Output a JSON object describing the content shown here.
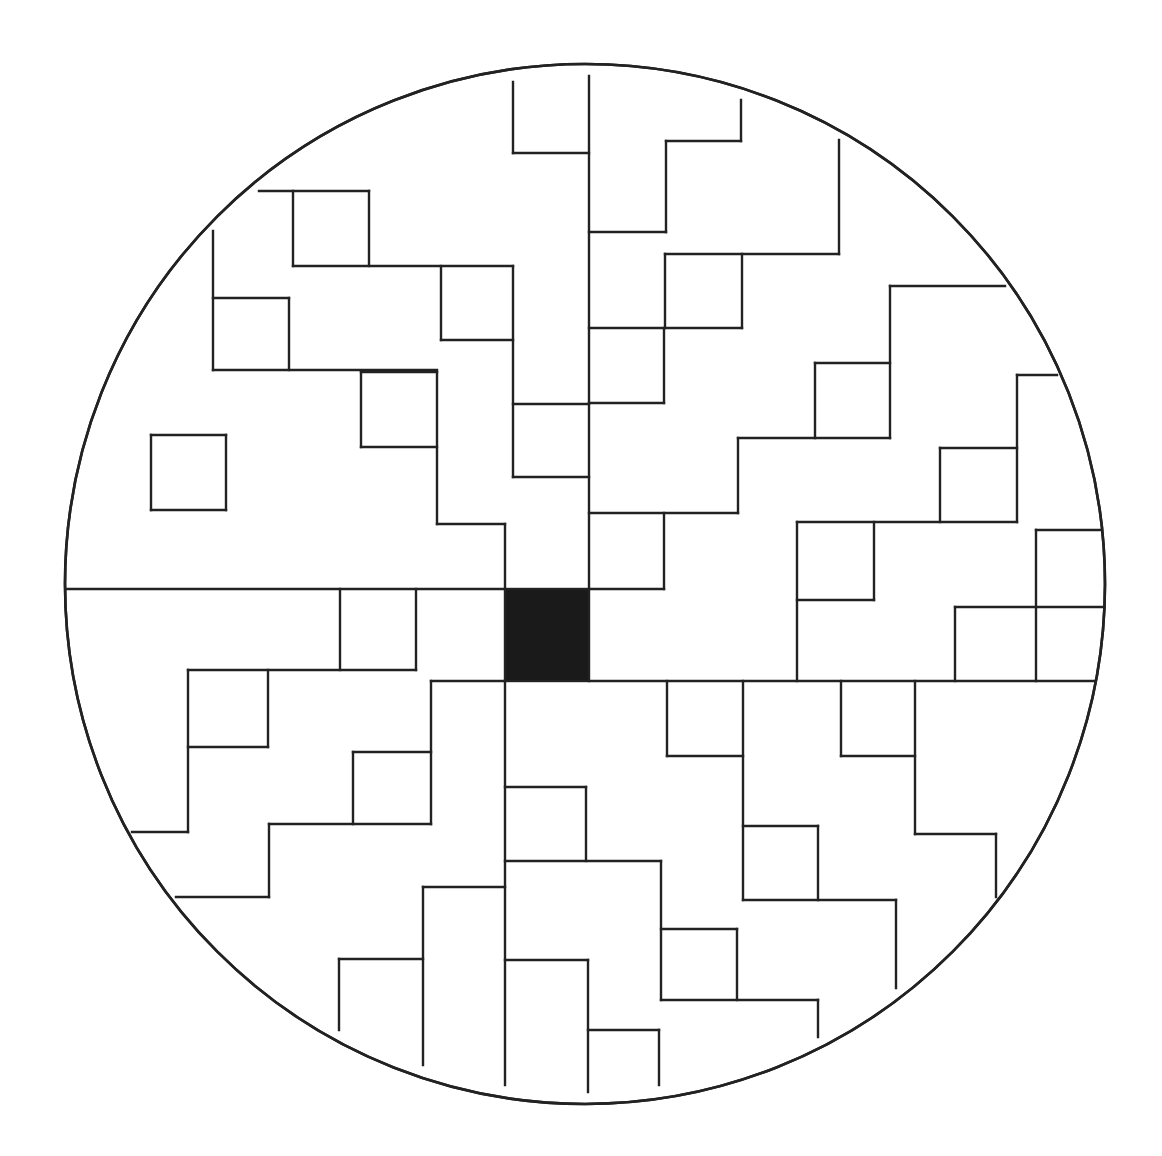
{
  "diagram": {
    "type": "circular-maze-pattern",
    "colors": {
      "background": "#ffffff",
      "line": "#222222",
      "center_fill": "#1a1a1a"
    },
    "circle": {
      "cx": 585,
      "cy": 584,
      "r": 520
    },
    "center_square": {
      "x": 505,
      "y": 589,
      "w": 84,
      "h": 92
    },
    "segments": [
      [
        65,
        589,
        505,
        589
      ],
      [
        589,
        76,
        589,
        589
      ],
      [
        513,
        82,
        513,
        153
      ],
      [
        513,
        153,
        589,
        153
      ],
      [
        259,
        191,
        369,
        191
      ],
      [
        293,
        191,
        293,
        266
      ],
      [
        369,
        191,
        369,
        266
      ],
      [
        293,
        266,
        513,
        266
      ],
      [
        441,
        266,
        441,
        340
      ],
      [
        441,
        340,
        513,
        340
      ],
      [
        513,
        266,
        513,
        477
      ],
      [
        513,
        404,
        589,
        404
      ],
      [
        513,
        477,
        589,
        477
      ],
      [
        213,
        231,
        213,
        370
      ],
      [
        213,
        298,
        289,
        298
      ],
      [
        289,
        298,
        289,
        370
      ],
      [
        213,
        370,
        437,
        370
      ],
      [
        361,
        372,
        437,
        372
      ],
      [
        361,
        372,
        361,
        447
      ],
      [
        361,
        447,
        437,
        447
      ],
      [
        437,
        372,
        437,
        524
      ],
      [
        437,
        524,
        505,
        524
      ],
      [
        505,
        524,
        505,
        589
      ],
      [
        151,
        435,
        226,
        435
      ],
      [
        151,
        510,
        226,
        510
      ],
      [
        151,
        435,
        151,
        510
      ],
      [
        226,
        435,
        226,
        510
      ],
      [
        741,
        100,
        741,
        141
      ],
      [
        666,
        141,
        741,
        141
      ],
      [
        666,
        141,
        666,
        232
      ],
      [
        589,
        232,
        666,
        232
      ],
      [
        839,
        140,
        839,
        254
      ],
      [
        665,
        254,
        839,
        254
      ],
      [
        665,
        254,
        665,
        328
      ],
      [
        742,
        254,
        742,
        328
      ],
      [
        589,
        328,
        742,
        328
      ],
      [
        664,
        328,
        664,
        403
      ],
      [
        589,
        403,
        664,
        403
      ],
      [
        589,
        513,
        738,
        513
      ],
      [
        738,
        438,
        738,
        513
      ],
      [
        738,
        438,
        890,
        438
      ],
      [
        815,
        363,
        815,
        438
      ],
      [
        815,
        363,
        890,
        363
      ],
      [
        890,
        286,
        890,
        438
      ],
      [
        890,
        286,
        1005,
        286
      ],
      [
        664,
        513,
        664,
        589
      ],
      [
        589,
        589,
        664,
        589
      ],
      [
        1017,
        375,
        1057,
        375
      ],
      [
        1017,
        375,
        1017,
        522
      ],
      [
        940,
        448,
        1017,
        448
      ],
      [
        940,
        448,
        940,
        522
      ],
      [
        797,
        522,
        1017,
        522
      ],
      [
        797,
        522,
        797,
        681
      ],
      [
        874,
        522,
        874,
        600
      ],
      [
        797,
        600,
        874,
        600
      ],
      [
        1036,
        530,
        1102,
        530
      ],
      [
        1036,
        530,
        1036,
        681
      ],
      [
        955,
        607,
        1105,
        607
      ],
      [
        955,
        607,
        955,
        681
      ],
      [
        589,
        681,
        1096,
        681
      ],
      [
        340,
        589,
        340,
        670
      ],
      [
        416,
        589,
        416,
        670
      ],
      [
        188,
        670,
        416,
        670
      ],
      [
        188,
        670,
        188,
        832
      ],
      [
        268,
        670,
        268,
        747
      ],
      [
        188,
        747,
        268,
        747
      ],
      [
        132,
        832,
        188,
        832
      ],
      [
        431,
        681,
        505,
        681
      ],
      [
        431,
        681,
        431,
        824
      ],
      [
        353,
        752,
        431,
        752
      ],
      [
        353,
        752,
        353,
        824
      ],
      [
        269,
        824,
        431,
        824
      ],
      [
        269,
        824,
        269,
        897
      ],
      [
        176,
        897,
        269,
        897
      ],
      [
        505,
        681,
        505,
        1085
      ],
      [
        423,
        887,
        505,
        887
      ],
      [
        423,
        887,
        423,
        1065
      ],
      [
        339,
        959,
        423,
        959
      ],
      [
        339,
        959,
        339,
        1030
      ],
      [
        667,
        681,
        667,
        756
      ],
      [
        667,
        756,
        743,
        756
      ],
      [
        743,
        681,
        743,
        900
      ],
      [
        743,
        826,
        818,
        826
      ],
      [
        818,
        826,
        818,
        900
      ],
      [
        743,
        900,
        896,
        900
      ],
      [
        896,
        900,
        896,
        988
      ],
      [
        841,
        681,
        841,
        756
      ],
      [
        841,
        756,
        915,
        756
      ],
      [
        915,
        681,
        915,
        834
      ],
      [
        915,
        834,
        996,
        834
      ],
      [
        996,
        834,
        996,
        897
      ],
      [
        505,
        787,
        586,
        787
      ],
      [
        586,
        787,
        586,
        861
      ],
      [
        505,
        861,
        661,
        861
      ],
      [
        661,
        861,
        661,
        1000
      ],
      [
        661,
        929,
        737,
        929
      ],
      [
        737,
        929,
        737,
        1000
      ],
      [
        661,
        1000,
        818,
        1000
      ],
      [
        818,
        1000,
        818,
        1037
      ],
      [
        505,
        960,
        588,
        960
      ],
      [
        588,
        960,
        588,
        1092
      ],
      [
        588,
        1030,
        659,
        1030
      ],
      [
        659,
        1030,
        659,
        1085
      ]
    ]
  }
}
